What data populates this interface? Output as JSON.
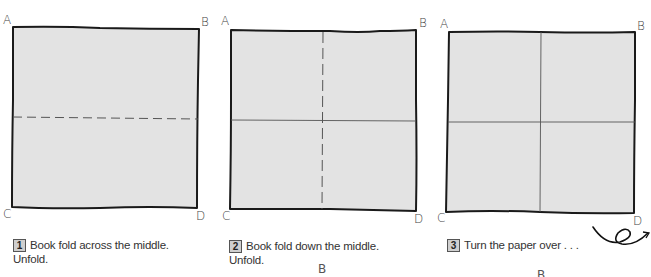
{
  "colors": {
    "paper_fill": "#e3e3e3",
    "edge": "#1a1a1a",
    "crease": "#555555",
    "badge_fill": "#cfcfcf"
  },
  "steps": [
    {
      "number": "1",
      "text_line1": "Book fold across the middle.",
      "text_line2": "Unfold.",
      "corners": {
        "tl": "A",
        "tr": "B",
        "bl": "C",
        "br": "D"
      }
    },
    {
      "number": "2",
      "text_line1": "Book fold down the middle.",
      "text_line2": "Unfold.",
      "corners": {
        "tl": "A",
        "tr": "B",
        "bl": "C",
        "br": "D"
      }
    },
    {
      "number": "3",
      "text_line1": "Turn the paper over . . .",
      "text_line2": "",
      "corners": {
        "tl": "A",
        "tr": "B",
        "bl": "C",
        "br": "D"
      }
    }
  ],
  "stray_labels": [
    "B",
    "B"
  ],
  "icons": {
    "turn_over": "turn-over-arrow-icon"
  }
}
